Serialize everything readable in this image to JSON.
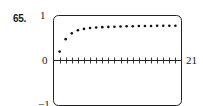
{
  "problem": {
    "number": "65."
  },
  "chart_data": {
    "type": "scatter",
    "title": "",
    "xlabel": "",
    "ylabel": "",
    "xlim": [
      0,
      21
    ],
    "ylim": [
      -1,
      1
    ],
    "grid": false,
    "legend": null,
    "tick_labels": {
      "y_top": "1",
      "y_zero": "0",
      "y_bottom": "−1",
      "x_right": "21"
    },
    "x_ticks_every": 1,
    "series": [
      {
        "name": "sequence",
        "x": [
          1,
          2,
          3,
          4,
          5,
          6,
          7,
          8,
          9,
          10,
          11,
          12,
          13,
          14,
          15,
          16,
          17,
          18,
          19,
          20
        ],
        "values": [
          0.2,
          0.48,
          0.61,
          0.68,
          0.71,
          0.73,
          0.74,
          0.75,
          0.755,
          0.76,
          0.765,
          0.77,
          0.77,
          0.775,
          0.775,
          0.775,
          0.78,
          0.78,
          0.78,
          0.78
        ]
      }
    ]
  }
}
